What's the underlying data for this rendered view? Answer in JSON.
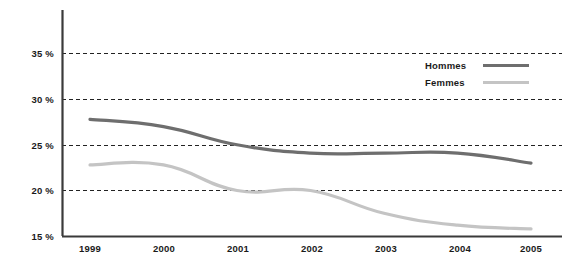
{
  "chart_data": {
    "type": "line",
    "title": "",
    "subtitle": "",
    "xlabel": "",
    "ylabel": "",
    "categories": [
      "1999",
      "2000",
      "2001",
      "2002",
      "2003",
      "2004",
      "2005"
    ],
    "x": [
      1999,
      2000,
      2001,
      2002,
      2003,
      2004,
      2005
    ],
    "series": [
      {
        "name": "Hommes",
        "color": "#6e6e6e",
        "values": [
          27.8,
          27.0,
          25.0,
          24.1,
          24.1,
          24.1,
          23.0
        ]
      },
      {
        "name": "Femmes",
        "color": "#c4c4c4",
        "values": [
          22.8,
          22.8,
          20.0,
          20.0,
          17.5,
          16.2,
          15.8
        ]
      }
    ],
    "ylim": [
      15,
      35
    ],
    "xlim": [
      1999,
      2005
    ],
    "yticks": [
      15,
      20,
      25,
      30,
      35
    ],
    "ytick_labels": [
      "15 %",
      "20 %",
      "25 %",
      "30 %",
      "35 %"
    ],
    "xtick_labels": [
      "1999",
      "2000",
      "2001",
      "2002",
      "2003",
      "2004",
      "2005"
    ],
    "grid": true,
    "grid_style": "dashed",
    "grid_axis": "y",
    "legend_position": "top-right",
    "legend_entries": [
      "Hommes",
      "Femmes"
    ]
  },
  "axes": {
    "y_ticks": [
      {
        "label": "35 %",
        "value": 35
      },
      {
        "label": "30 %",
        "value": 30
      },
      {
        "label": "25 %",
        "value": 25
      },
      {
        "label": "20 %",
        "value": 20
      },
      {
        "label": "15 %",
        "value": 15
      }
    ],
    "x_ticks": [
      {
        "label": "1999"
      },
      {
        "label": "2000"
      },
      {
        "label": "2001"
      },
      {
        "label": "2002"
      },
      {
        "label": "2003"
      },
      {
        "label": "2004"
      },
      {
        "label": "2005"
      }
    ]
  },
  "legend": {
    "items": [
      {
        "label": "Hommes",
        "color": "#6e6e6e"
      },
      {
        "label": "Femmes",
        "color": "#c4c4c4"
      }
    ]
  },
  "colors": {
    "hommes": "#6e6e6e",
    "femmes": "#c4c4c4",
    "axis": "#3a3a3a",
    "grid": "#222222",
    "text": "#1a1a1a",
    "background": "#ffffff"
  }
}
